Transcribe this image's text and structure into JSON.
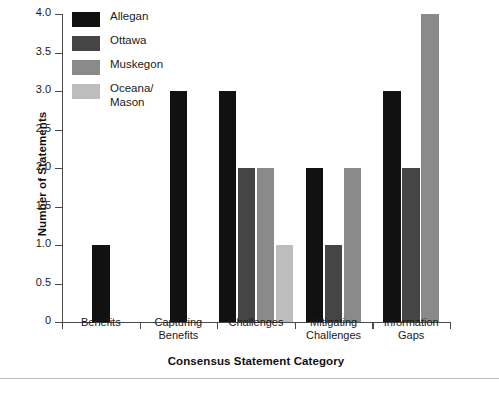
{
  "chart_data": {
    "type": "bar",
    "title": "",
    "xlabel": "Consensus Statement Category",
    "ylabel": "Number of Statements",
    "categories": [
      "Benefits",
      "Capturing\nBenefits",
      "Challenges",
      "Mitigating\nChallenges",
      "Information\nGaps"
    ],
    "series": [
      {
        "name": "Allegan",
        "color": "#111111",
        "values": [
          1,
          3,
          3,
          2,
          3
        ]
      },
      {
        "name": "Ottawa",
        "color": "#454545",
        "values": [
          0,
          0,
          2,
          1,
          2
        ]
      },
      {
        "name": "Muskegon",
        "color": "#8a8a8a",
        "values": [
          0,
          0,
          2,
          2,
          4
        ]
      },
      {
        "name": "Oceana/\nMason",
        "color": "#bdbdbd",
        "values": [
          0,
          0,
          1,
          0,
          0
        ]
      }
    ],
    "ylim": [
      0,
      4
    ],
    "yticks": [
      0,
      0.5,
      1,
      1.5,
      2,
      2.5,
      3,
      3.5,
      4
    ],
    "ytick_labels": [
      "0",
      "0.5",
      "1.0",
      "1.5",
      "2.0",
      "2.5",
      "3.0",
      "3.5",
      "4.0"
    ],
    "grid": false,
    "legend_position": "upper-left",
    "legend_entries": [
      "Allegan",
      "Ottawa",
      "Muskegon",
      "Oceana/\nMason"
    ]
  }
}
